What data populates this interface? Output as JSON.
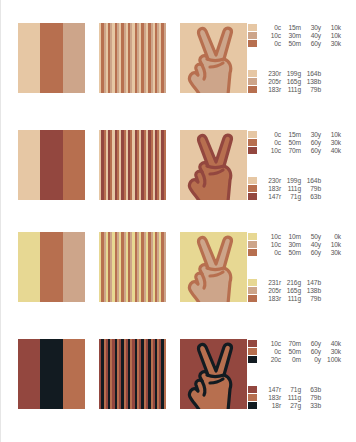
{
  "rows": [
    {
      "bands": [
        "#e6c7a4",
        "#b76f4f",
        "#cda58a"
      ],
      "stripes": [
        "#e6c7a4",
        "#b76f4f",
        "#cda58a"
      ],
      "hand": {
        "bg": "#e6c7a4",
        "fill": "#cda58a",
        "outline": "#b76f4f"
      },
      "cmyk": [
        {
          "swatch": "#e6c7a4",
          "c": "0c",
          "m": "15m",
          "y": "30y",
          "k": "10k"
        },
        {
          "swatch": "#cda58a",
          "c": "10c",
          "m": "30m",
          "y": "40y",
          "k": "10k"
        },
        {
          "swatch": "#b76f4f",
          "c": "0c",
          "m": "50m",
          "y": "60y",
          "k": "30k"
        }
      ],
      "rgb": [
        {
          "swatch": "#e6c7a4",
          "r": "230r",
          "g": "199g",
          "b": "164b"
        },
        {
          "swatch": "#cda58a",
          "r": "205r",
          "g": "165g",
          "b": "138b"
        },
        {
          "swatch": "#b76f4f",
          "r": "183r",
          "g": "111g",
          "b": "79b"
        }
      ]
    },
    {
      "bands": [
        "#e6c7a4",
        "#93473f",
        "#b76f4f"
      ],
      "stripes": [
        "#e6c7a4",
        "#93473f",
        "#b76f4f"
      ],
      "hand": {
        "bg": "#e6c7a4",
        "fill": "#b76f4f",
        "outline": "#93473f"
      },
      "cmyk": [
        {
          "swatch": "#e6c7a4",
          "c": "0c",
          "m": "15m",
          "y": "30y",
          "k": "10k"
        },
        {
          "swatch": "#b76f4f",
          "c": "0c",
          "m": "50m",
          "y": "60y",
          "k": "30k"
        },
        {
          "swatch": "#93473f",
          "c": "10c",
          "m": "70m",
          "y": "60y",
          "k": "40k"
        }
      ],
      "rgb": [
        {
          "swatch": "#e6c7a4",
          "r": "230r",
          "g": "199g",
          "b": "164b"
        },
        {
          "swatch": "#b76f4f",
          "r": "183r",
          "g": "111g",
          "b": "79b"
        },
        {
          "swatch": "#93473f",
          "r": "147r",
          "g": "71g",
          "b": "63b"
        }
      ]
    },
    {
      "bands": [
        "#e7d893",
        "#b76f4f",
        "#cda58a"
      ],
      "stripes": [
        "#e7d893",
        "#b76f4f",
        "#cda58a"
      ],
      "hand": {
        "bg": "#e7d893",
        "fill": "#cda58a",
        "outline": "#b76f4f"
      },
      "cmyk": [
        {
          "swatch": "#e7d893",
          "c": "10c",
          "m": "10m",
          "y": "50y",
          "k": "0k"
        },
        {
          "swatch": "#cda58a",
          "c": "10c",
          "m": "30m",
          "y": "40y",
          "k": "10k"
        },
        {
          "swatch": "#b76f4f",
          "c": "0c",
          "m": "50m",
          "y": "60y",
          "k": "30k"
        }
      ],
      "rgb": [
        {
          "swatch": "#e7d893",
          "r": "231r",
          "g": "216g",
          "b": "147b"
        },
        {
          "swatch": "#cda58a",
          "r": "205r",
          "g": "165g",
          "b": "138b"
        },
        {
          "swatch": "#b76f4f",
          "r": "183r",
          "g": "111g",
          "b": "79b"
        }
      ]
    },
    {
      "bands": [
        "#93473f",
        "#121b21",
        "#b76f4f"
      ],
      "stripes": [
        "#93473f",
        "#121b21",
        "#b76f4f"
      ],
      "hand": {
        "bg": "#93473f",
        "fill": "#b76f4f",
        "outline": "#121b21"
      },
      "cmyk": [
        {
          "swatch": "#93473f",
          "c": "10c",
          "m": "70m",
          "y": "60y",
          "k": "40k"
        },
        {
          "swatch": "#b76f4f",
          "c": "0c",
          "m": "50m",
          "y": "60y",
          "k": "30k"
        },
        {
          "swatch": "#121b21",
          "c": "20c",
          "m": "0m",
          "y": "0y",
          "k": "100k"
        }
      ],
      "rgb": [
        {
          "swatch": "#93473f",
          "r": "147r",
          "g": "71g",
          "b": "63b"
        },
        {
          "swatch": "#b76f4f",
          "r": "183r",
          "g": "111g",
          "b": "79b"
        },
        {
          "swatch": "#121b21",
          "r": "18r",
          "g": "27g",
          "b": "33b"
        }
      ]
    }
  ]
}
